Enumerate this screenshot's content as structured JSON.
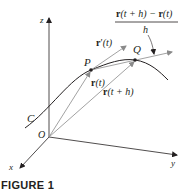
{
  "figure": {
    "caption": "FIGURE 1",
    "axes": {
      "x": "x",
      "y": "y",
      "z": "z"
    },
    "origin_label": "O",
    "curve_label": "C",
    "points": {
      "P": "P",
      "Q": "Q"
    },
    "vectors": {
      "r_t": {
        "bold": "r",
        "arg": "(t)"
      },
      "r_t_plus_h": {
        "bold": "r",
        "arg": "(t + h)"
      },
      "r_prime_t": {
        "bold": "r",
        "prime": "′",
        "arg": "(t)"
      }
    },
    "difference_quotient": {
      "numerator_bold_1": "r",
      "numerator_arg_1": "(t + h) − ",
      "numerator_bold_2": "r",
      "numerator_arg_2": "(t)",
      "denominator": "h"
    },
    "colors": {
      "ink": "#231f20",
      "vector_gray": "#8a8a8a"
    }
  }
}
